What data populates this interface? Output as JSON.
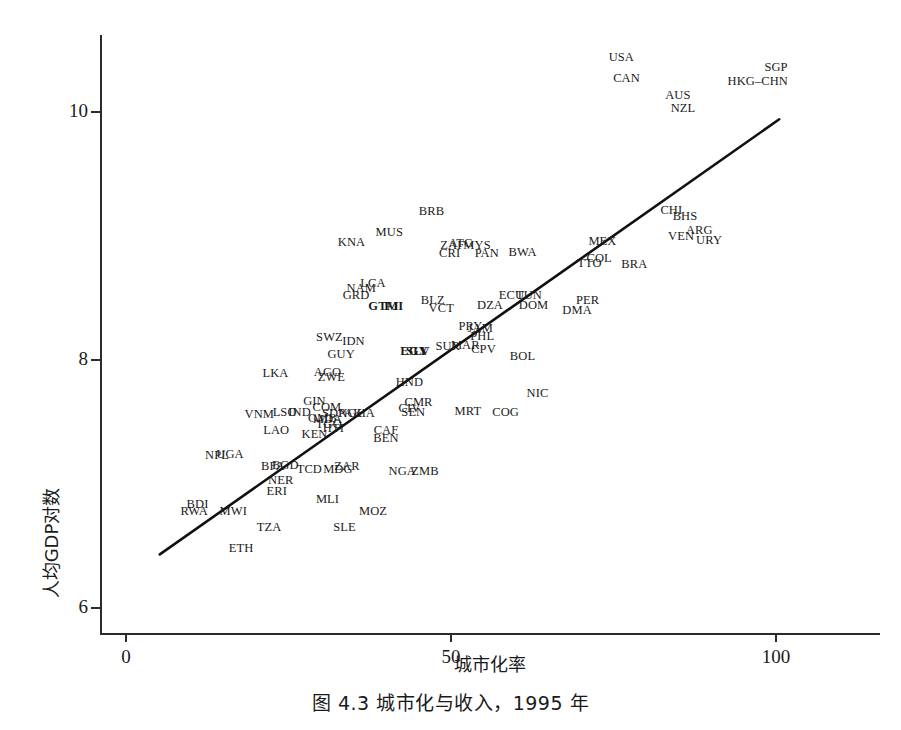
{
  "caption": "图 4.3   城市化与收入，1995 年",
  "axes": {
    "x_title": "城市化率",
    "y_title": "人均GDP对数",
    "x_ticks": [
      {
        "value": 0,
        "label": "0"
      },
      {
        "value": 50,
        "label": "50"
      },
      {
        "value": 100,
        "label": "100"
      }
    ],
    "y_ticks": [
      {
        "value": 6,
        "label": "6"
      },
      {
        "value": 8,
        "label": "8"
      },
      {
        "value": 10,
        "label": "10"
      }
    ],
    "xlim": [
      -4,
      116
    ],
    "ylim": [
      5.78,
      10.62
    ],
    "grid": false
  },
  "colors": {
    "axis": "#2b2b2b",
    "text": "#1a1a1a",
    "fit_line": "#111111",
    "background": "#ffffff"
  },
  "chart_data": {
    "type": "scatter",
    "title": "图 4.3   城市化与收入，1995 年",
    "xlabel": "城市化率",
    "ylabel": "人均GDP对数",
    "xlim": [
      -4,
      116
    ],
    "ylim": [
      5.78,
      10.62
    ],
    "grid": false,
    "legend": null,
    "point_render": "label-only",
    "fit_line": {
      "label": "regression-line",
      "x_start": 5.2,
      "y_start": 6.43,
      "x_end": 100.5,
      "y_end": 9.94
    },
    "points": [
      {
        "label": "USA",
        "x": 76.2,
        "y": 10.44
      },
      {
        "label": "CAN",
        "x": 77.0,
        "y": 10.27
      },
      {
        "label": "SGP",
        "x": 100.0,
        "y": 10.36
      },
      {
        "label": "HKG–CHN",
        "x": 97.2,
        "y": 10.25
      },
      {
        "label": "AUS",
        "x": 84.9,
        "y": 10.14
      },
      {
        "label": "NZL",
        "x": 85.7,
        "y": 10.03
      },
      {
        "label": "CHI",
        "x": 83.9,
        "y": 9.21
      },
      {
        "label": "BHS",
        "x": 86.0,
        "y": 9.16
      },
      {
        "label": "ARG",
        "x": 88.2,
        "y": 9.05
      },
      {
        "label": "VEN",
        "x": 85.4,
        "y": 9.0
      },
      {
        "label": "URY",
        "x": 89.7,
        "y": 8.97
      },
      {
        "label": "BRB",
        "x": 47.0,
        "y": 9.2
      },
      {
        "label": "MUS",
        "x": 40.5,
        "y": 9.03
      },
      {
        "label": "KNA",
        "x": 34.7,
        "y": 8.95
      },
      {
        "label": "MEX",
        "x": 73.3,
        "y": 8.96
      },
      {
        "label": "ZAF",
        "x": 50.2,
        "y": 8.93
      },
      {
        "label": "ATG",
        "x": 51.5,
        "y": 8.94
      },
      {
        "label": "MYS",
        "x": 54.0,
        "y": 8.93
      },
      {
        "label": "CRI",
        "x": 49.8,
        "y": 8.86
      },
      {
        "label": "PAN",
        "x": 55.5,
        "y": 8.86
      },
      {
        "label": "BWA",
        "x": 61.0,
        "y": 8.87
      },
      {
        "label": "COL",
        "x": 72.8,
        "y": 8.82
      },
      {
        "label": "TTO",
        "x": 71.3,
        "y": 8.78
      },
      {
        "label": "BRA",
        "x": 78.2,
        "y": 8.77
      },
      {
        "label": "LCA",
        "x": 38.0,
        "y": 8.62
      },
      {
        "label": "NAM",
        "x": 36.2,
        "y": 8.58
      },
      {
        "label": "GRD",
        "x": 35.4,
        "y": 8.52
      },
      {
        "label": "GTM",
        "x": 39.6,
        "y": 8.43
      },
      {
        "label": "FJI",
        "x": 41.2,
        "y": 8.43
      },
      {
        "label": "BLZ",
        "x": 47.2,
        "y": 8.48
      },
      {
        "label": "VCT",
        "x": 48.5,
        "y": 8.42
      },
      {
        "label": "DZA",
        "x": 56.0,
        "y": 8.44
      },
      {
        "label": "ECU",
        "x": 59.3,
        "y": 8.52
      },
      {
        "label": "TUN",
        "x": 62.0,
        "y": 8.52
      },
      {
        "label": "DOM",
        "x": 62.7,
        "y": 8.44
      },
      {
        "label": "PER",
        "x": 71.0,
        "y": 8.48
      },
      {
        "label": "DMA",
        "x": 69.4,
        "y": 8.4
      },
      {
        "label": "SWZ",
        "x": 31.3,
        "y": 8.18
      },
      {
        "label": "IDN",
        "x": 35.0,
        "y": 8.15
      },
      {
        "label": "PRY",
        "x": 53.0,
        "y": 8.27
      },
      {
        "label": "JAM",
        "x": 54.5,
        "y": 8.26
      },
      {
        "label": "PHL",
        "x": 54.8,
        "y": 8.19
      },
      {
        "label": "MAR",
        "x": 52.2,
        "y": 8.12
      },
      {
        "label": "CPV",
        "x": 55.0,
        "y": 8.09
      },
      {
        "label": "SUR",
        "x": 49.5,
        "y": 8.11
      },
      {
        "label": "EGY",
        "x": 44.3,
        "y": 8.07
      },
      {
        "label": "SLV",
        "x": 44.9,
        "y": 8.07
      },
      {
        "label": "GUY",
        "x": 33.1,
        "y": 8.05
      },
      {
        "label": "BOL",
        "x": 61.0,
        "y": 8.03
      },
      {
        "label": "LKA",
        "x": 23.0,
        "y": 7.89
      },
      {
        "label": "AGO",
        "x": 31.0,
        "y": 7.9
      },
      {
        "label": "ZWE",
        "x": 31.6,
        "y": 7.86
      },
      {
        "label": "HND",
        "x": 43.6,
        "y": 7.82
      },
      {
        "label": "NIC",
        "x": 63.3,
        "y": 7.73
      },
      {
        "label": "GIN",
        "x": 29.0,
        "y": 7.67
      },
      {
        "label": "CMR",
        "x": 45.0,
        "y": 7.66
      },
      {
        "label": "CIV",
        "x": 43.6,
        "y": 7.61
      },
      {
        "label": "SEN",
        "x": 44.2,
        "y": 7.58
      },
      {
        "label": "MRT",
        "x": 52.6,
        "y": 7.59
      },
      {
        "label": "COG",
        "x": 58.4,
        "y": 7.58
      },
      {
        "label": "COM",
        "x": 30.9,
        "y": 7.62
      },
      {
        "label": "VNM",
        "x": 20.5,
        "y": 7.56
      },
      {
        "label": "LSO",
        "x": 24.4,
        "y": 7.58
      },
      {
        "label": "IND",
        "x": 26.7,
        "y": 7.58
      },
      {
        "label": "SDN",
        "x": 32.1,
        "y": 7.57
      },
      {
        "label": "PAK",
        "x": 34.5,
        "y": 7.57
      },
      {
        "label": "GHA",
        "x": 36.2,
        "y": 7.57
      },
      {
        "label": "GMB",
        "x": 30.2,
        "y": 7.53
      },
      {
        "label": "MDA",
        "x": 31.0,
        "y": 7.52
      },
      {
        "label": "TGO",
        "x": 31.2,
        "y": 7.48
      },
      {
        "label": "HTI",
        "x": 31.9,
        "y": 7.45
      },
      {
        "label": "LAO",
        "x": 23.1,
        "y": 7.43
      },
      {
        "label": "KEN",
        "x": 29.0,
        "y": 7.4
      },
      {
        "label": "CAF",
        "x": 40.0,
        "y": 7.43
      },
      {
        "label": "BEN",
        "x": 40.0,
        "y": 7.37
      },
      {
        "label": "NPL",
        "x": 14.0,
        "y": 7.23
      },
      {
        "label": "UGA",
        "x": 16.0,
        "y": 7.24
      },
      {
        "label": "BFA",
        "x": 22.6,
        "y": 7.14
      },
      {
        "label": "BGD",
        "x": 24.5,
        "y": 7.15
      },
      {
        "label": "TCD",
        "x": 28.2,
        "y": 7.12
      },
      {
        "label": "MDG",
        "x": 32.6,
        "y": 7.12
      },
      {
        "label": "ZAR",
        "x": 34.0,
        "y": 7.14
      },
      {
        "label": "NGA",
        "x": 42.5,
        "y": 7.1
      },
      {
        "label": "ZMB",
        "x": 46.0,
        "y": 7.1
      },
      {
        "label": "NER",
        "x": 23.8,
        "y": 7.03
      },
      {
        "label": "ERI",
        "x": 23.2,
        "y": 6.94
      },
      {
        "label": "MLI",
        "x": 31.0,
        "y": 6.88
      },
      {
        "label": "BDI",
        "x": 11.0,
        "y": 6.84
      },
      {
        "label": "RWA",
        "x": 10.5,
        "y": 6.78
      },
      {
        "label": "MWI",
        "x": 16.5,
        "y": 6.78
      },
      {
        "label": "MOZ",
        "x": 38.0,
        "y": 6.78
      },
      {
        "label": "TZA",
        "x": 22.0,
        "y": 6.65
      },
      {
        "label": "SLE",
        "x": 33.6,
        "y": 6.65
      },
      {
        "label": "ETH",
        "x": 17.7,
        "y": 6.48
      }
    ]
  }
}
